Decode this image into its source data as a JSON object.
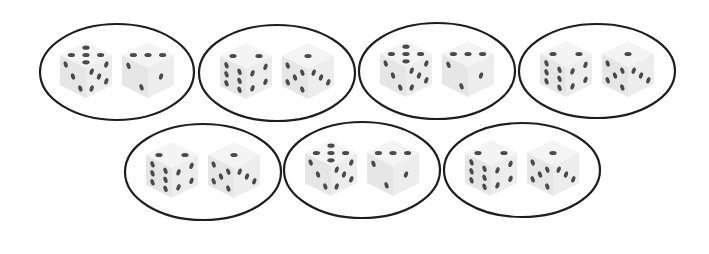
{
  "figure": {
    "colors": {
      "background": "#ffffff",
      "outline": "#1e1e1e",
      "pip": "#4a4a4a",
      "die_light": "#f4f4f4",
      "die_mid": "#ebebeb"
    }
  },
  "pairs": [
    {
      "id": 1,
      "cx": 117,
      "cy": 72,
      "rx": 77,
      "ry": 48,
      "type": "A",
      "dice": [
        {
          "top": 5,
          "left": 3,
          "right": 5
        },
        {
          "top": 3,
          "left": 2,
          "right": 1
        }
      ]
    },
    {
      "id": 2,
      "cx": 277,
      "cy": 73,
      "rx": 78,
      "ry": 48,
      "type": "B",
      "dice": [
        {
          "top": 2,
          "left": 6,
          "right": 4
        },
        {
          "top": 1,
          "left": 5,
          "right": 3
        }
      ]
    },
    {
      "id": 3,
      "cx": 437,
      "cy": 71,
      "rx": 78,
      "ry": 48,
      "type": "A",
      "dice": [
        {
          "top": 5,
          "left": 3,
          "right": 5
        },
        {
          "top": 3,
          "left": 2,
          "right": 1
        }
      ]
    },
    {
      "id": 4,
      "cx": 597,
      "cy": 71,
      "rx": 78,
      "ry": 47,
      "type": "B",
      "dice": [
        {
          "top": 2,
          "left": 6,
          "right": 4
        },
        {
          "top": 1,
          "left": 5,
          "right": 3
        }
      ]
    },
    {
      "id": 5,
      "cx": 203,
      "cy": 172,
      "rx": 78,
      "ry": 48,
      "type": "B",
      "dice": [
        {
          "top": 2,
          "left": 6,
          "right": 4
        },
        {
          "top": 1,
          "left": 5,
          "right": 3
        }
      ]
    },
    {
      "id": 6,
      "cx": 362,
      "cy": 170,
      "rx": 78,
      "ry": 48,
      "type": "A",
      "dice": [
        {
          "top": 5,
          "left": 3,
          "right": 5
        },
        {
          "top": 3,
          "left": 2,
          "right": 1
        }
      ]
    },
    {
      "id": 7,
      "cx": 522,
      "cy": 170,
      "rx": 78,
      "ry": 47,
      "type": "B",
      "dice": [
        {
          "top": 2,
          "left": 6,
          "right": 4
        },
        {
          "top": 1,
          "left": 5,
          "right": 3
        }
      ]
    }
  ]
}
